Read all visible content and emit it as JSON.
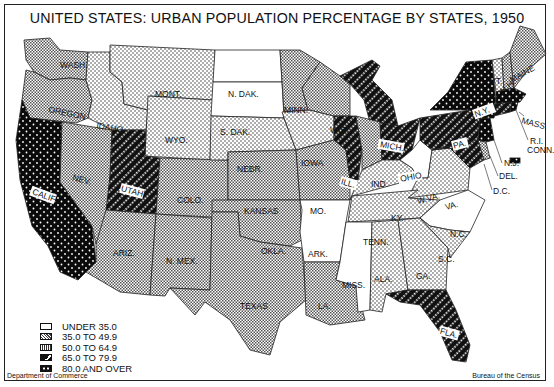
{
  "title": "UNITED STATES: URBAN POPULATION PERCENTAGE BY STATES, 1950",
  "footer": {
    "left": "Department of Commerce",
    "right": "Bureau of the Census"
  },
  "legend": {
    "items": [
      {
        "label": "UNDER 35.0",
        "pattern": "white"
      },
      {
        "label": "35.0 TO 49.9",
        "pattern": "light-dots"
      },
      {
        "label": "50.0 TO 64.9",
        "pattern": "crosshatch"
      },
      {
        "label": "65.0 TO 79.9",
        "pattern": "black-diagonal"
      },
      {
        "label": "80.0 AND OVER",
        "pattern": "black-dots"
      }
    ]
  },
  "states": [
    {
      "abbr": "WASH",
      "category": "50.0 TO 64.9"
    },
    {
      "abbr": "OREGON",
      "category": "50.0 TO 64.9"
    },
    {
      "abbr": "CALIF",
      "category": "80.0 AND OVER"
    },
    {
      "abbr": "IDAHO",
      "category": "35.0 TO 49.9"
    },
    {
      "abbr": "NEV",
      "category": "50.0 TO 64.9"
    },
    {
      "abbr": "MONT",
      "category": "35.0 TO 49.9"
    },
    {
      "abbr": "WYO",
      "category": "35.0 TO 49.9"
    },
    {
      "abbr": "UTAH",
      "category": "65.0 TO 79.9"
    },
    {
      "abbr": "COLO",
      "category": "50.0 TO 64.9"
    },
    {
      "abbr": "ARIZ",
      "category": "50.0 TO 64.9"
    },
    {
      "abbr": "N. MEX",
      "category": "50.0 TO 64.9"
    },
    {
      "abbr": "N. DAK",
      "category": "UNDER 35.0"
    },
    {
      "abbr": "S. DAK",
      "category": "UNDER 35.0"
    },
    {
      "abbr": "NEBR",
      "category": "35.0 TO 49.9"
    },
    {
      "abbr": "KANSAS",
      "category": "50.0 TO 64.9"
    },
    {
      "abbr": "OKLA",
      "category": "50.0 TO 64.9"
    },
    {
      "abbr": "TEXAS",
      "category": "50.0 TO 64.9"
    },
    {
      "abbr": "MINN",
      "category": "50.0 TO 64.9"
    },
    {
      "abbr": "IOWA",
      "category": "35.0 TO 49.9"
    },
    {
      "abbr": "MO",
      "category": "50.0 TO 64.9"
    },
    {
      "abbr": "ARK",
      "category": "UNDER 35.0"
    },
    {
      "abbr": "LA",
      "category": "50.0 TO 64.9"
    },
    {
      "abbr": "WIS",
      "category": "50.0 TO 64.9"
    },
    {
      "abbr": "ILL",
      "category": "65.0 TO 79.9"
    },
    {
      "abbr": "MICH",
      "category": "65.0 TO 79.9"
    },
    {
      "abbr": "IND",
      "category": "50.0 TO 64.9"
    },
    {
      "abbr": "OHIO",
      "category": "65.0 TO 79.9"
    },
    {
      "abbr": "KY",
      "category": "35.0 TO 49.9"
    },
    {
      "abbr": "TENN",
      "category": "35.0 TO 49.9"
    },
    {
      "abbr": "MISS",
      "category": "UNDER 35.0"
    },
    {
      "abbr": "ALA",
      "category": "35.0 TO 49.9"
    },
    {
      "abbr": "GA",
      "category": "35.0 TO 49.9"
    },
    {
      "abbr": "FLA",
      "category": "65.0 TO 79.9"
    },
    {
      "abbr": "S.C",
      "category": "35.0 TO 49.9"
    },
    {
      "abbr": "N.C",
      "category": "UNDER 35.0"
    },
    {
      "abbr": "VA",
      "category": "35.0 TO 49.9"
    },
    {
      "abbr": "W.VA",
      "category": "UNDER 35.0"
    },
    {
      "abbr": "PA",
      "category": "65.0 TO 79.9"
    },
    {
      "abbr": "N.Y",
      "category": "80.0 AND OVER"
    },
    {
      "abbr": "N.J",
      "category": "80.0 AND OVER"
    },
    {
      "abbr": "DEL",
      "category": "50.0 TO 64.9"
    },
    {
      "abbr": "D.C",
      "category": "80.0 AND OVER"
    },
    {
      "abbr": "MD",
      "category": "65.0 TO 79.9"
    },
    {
      "abbr": "VT",
      "category": "35.0 TO 49.9"
    },
    {
      "abbr": "N.H",
      "category": "50.0 TO 64.9"
    },
    {
      "abbr": "MAINE",
      "category": "50.0 TO 64.9"
    },
    {
      "abbr": "MASS",
      "category": "80.0 AND OVER"
    },
    {
      "abbr": "R.I",
      "category": "80.0 AND OVER"
    },
    {
      "abbr": "CONN",
      "category": "65.0 TO 79.9"
    }
  ],
  "labels": {
    "WASH": "WASH.",
    "OREGON": "OREGON",
    "CALIF": "CALIF.",
    "IDAHO": "IDAHO",
    "NEV": "NEV.",
    "MONT": "MONT.",
    "WYO": "WYO.",
    "UTAH": "UTAH",
    "COLO": "COLO.",
    "ARIZ": "ARIZ.",
    "NMEX": "N. MEX.",
    "NDAK": "N. DAK.",
    "SDAK": "S. DAK.",
    "NEBR": "NEBR.",
    "KANSAS": "KANSAS",
    "OKLA": "OKLA.",
    "TEXAS": "TEXAS",
    "MINN": "MINN.",
    "IOWA": "IOWA",
    "MO": "MO.",
    "ARK": "ARK.",
    "LA": "LA.",
    "WIS": "WIS.",
    "ILL": "ILL.",
    "MICH": "MICH.",
    "IND": "IND.",
    "OHIO": "OHIO",
    "KY": "KY.",
    "TENN": "TENN.",
    "MISS": "MISS.",
    "ALA": "ALA.",
    "GA": "GA.",
    "FLA": "FLA.",
    "SC": "S.C.",
    "NC": "N.C.",
    "VA": "VA.",
    "WVA": "W.VA.",
    "PA": "PA.",
    "NY": "N.Y.",
    "NJ": "N.J.",
    "DEL": "DEL.",
    "DC": "D.C.",
    "VT": "VT.",
    "NH": "N.H.",
    "MAINE": "MAINE",
    "MASS": "MASS.",
    "RI": "R.I.",
    "CONN": "CONN."
  }
}
